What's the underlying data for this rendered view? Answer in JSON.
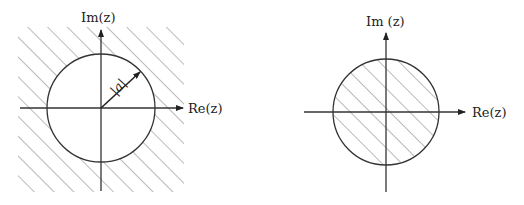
{
  "diagrams": [
    {
      "name": "exterior-region",
      "im_label": "Im(z)",
      "re_label": "Re(z)",
      "radius_label": "|a|",
      "shaded": "outside circle"
    },
    {
      "name": "interior-region",
      "im_label": "Im (z)",
      "re_label": "Re(z)",
      "shaded": "inside circle"
    }
  ],
  "colors": {
    "line": "#333333",
    "hatch": "#666666"
  }
}
